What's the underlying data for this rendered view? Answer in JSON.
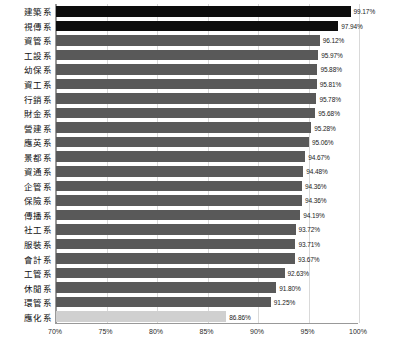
{
  "chart_data": {
    "type": "bar",
    "orientation": "horizontal",
    "title": "",
    "subtitle": "",
    "xlabel": "",
    "ylabel": "",
    "xlim": [
      70,
      100
    ],
    "xtick_labels": [
      "70%",
      "75%",
      "80%",
      "85%",
      "90%",
      "95%",
      "100%"
    ],
    "xticks": [
      70,
      75,
      80,
      85,
      90,
      95,
      100
    ],
    "grid": true,
    "grid_axis": "x",
    "legend": false,
    "legend_position": "none",
    "value_label_suffix": "%",
    "categories": [
      "建築系",
      "視傳系",
      "資管系",
      "工設系",
      "幼保系",
      "資工系",
      "行銷系",
      "財金系",
      "營建系",
      "應英系",
      "景都系",
      "資通系",
      "企管系",
      "保險系",
      "傳播系",
      "社工系",
      "服裝系",
      "會計系",
      "工管系",
      "休閒系",
      "環管系",
      "應化系"
    ],
    "values": [
      99.17,
      97.94,
      96.12,
      95.97,
      95.88,
      95.81,
      95.78,
      95.68,
      95.28,
      95.06,
      94.67,
      94.48,
      94.36,
      94.36,
      94.19,
      93.72,
      93.71,
      93.67,
      92.63,
      91.8,
      91.25,
      86.86
    ],
    "value_labels": [
      "99.17%",
      "97.94%",
      "96.12%",
      "95.97%",
      "95.88%",
      "95.81%",
      "95.78%",
      "95.68%",
      "95.28%",
      "95.06%",
      "94.67%",
      "94.48%",
      "94.36%",
      "94.36%",
      "94.19%",
      "93.72%",
      "93.71%",
      "93.67%",
      "92.63%",
      "91.80%",
      "91.25%",
      "86.86%"
    ],
    "bar_styles": [
      "dark",
      "dark",
      "normal",
      "normal",
      "normal",
      "normal",
      "normal",
      "normal",
      "normal",
      "normal",
      "normal",
      "normal",
      "normal",
      "normal",
      "normal",
      "normal",
      "normal",
      "normal",
      "normal",
      "normal",
      "normal",
      "highlight"
    ],
    "colors": {
      "bar_normal": "#595959",
      "bar_dark": "#0d0d0d",
      "bar_highlight": "#d0d0d0",
      "gridline": "#d9d9d9",
      "axis": "#999999",
      "text": "#111111"
    }
  }
}
